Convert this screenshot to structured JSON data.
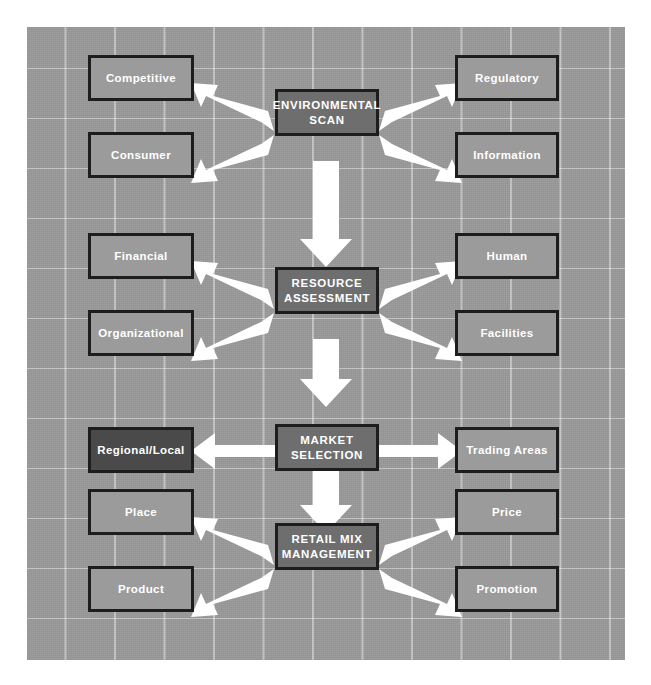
{
  "diagram": {
    "type": "flowchart",
    "background_color": "#9a9a9a",
    "grid_color": "#ffffff",
    "center_box_color": "#6e6e6e",
    "side_box_color": "#9b9b9b",
    "highlight_box_color": "#4a4a4a",
    "border_color": "#1d1d1d",
    "text_color": "#ffffff",
    "arrow_color": "#ffffff"
  },
  "stages": [
    {
      "id": "environmental-scan",
      "label": "ENVIRONMENTAL\nSCAN",
      "line1": "ENVIRONMENTAL",
      "line2": "SCAN",
      "left": [
        "Competitive",
        "Consumer"
      ],
      "right": [
        "Regulatory",
        "Information"
      ]
    },
    {
      "id": "resource-assessment",
      "label": "RESOURCE\nASSESSMENT",
      "line1": "RESOURCE",
      "line2": "ASSESSMENT",
      "left": [
        "Financial",
        "Organizational"
      ],
      "right": [
        "Human",
        "Facilities"
      ]
    },
    {
      "id": "market-selection",
      "label": "MARKET\nSELECTION",
      "line1": "MARKET",
      "line2": "SELECTION",
      "left": [
        "Regional/Local"
      ],
      "right": [
        "Trading Areas"
      ]
    },
    {
      "id": "retail-mix-management",
      "label": "RETAIL MIX\nMANAGEMENT",
      "line1": "RETAIL MIX",
      "line2": "MANAGEMENT",
      "left": [
        "Place",
        "Product"
      ],
      "right": [
        "Price",
        "Promotion"
      ]
    }
  ],
  "boxes": {
    "competitive": "Competitive",
    "consumer": "Consumer",
    "regulatory": "Regulatory",
    "information": "Information",
    "financial": "Financial",
    "organizational": "Organizational",
    "human": "Human",
    "facilities": "Facilities",
    "regional_local": "Regional/Local",
    "trading_areas": "Trading Areas",
    "place": "Place",
    "product": "Product",
    "price": "Price",
    "promotion": "Promotion",
    "env_scan_l1": "ENVIRONMENTAL",
    "env_scan_l2": "SCAN",
    "res_assess_l1": "RESOURCE",
    "res_assess_l2": "ASSESSMENT",
    "market_sel_l1": "MARKET",
    "market_sel_l2": "SELECTION",
    "retail_mix_l1": "RETAIL MIX",
    "retail_mix_l2": "MANAGEMENT"
  },
  "connectors": [
    {
      "name": "env-scan-to-competitive",
      "direction": "up-left"
    },
    {
      "name": "env-scan-to-consumer",
      "direction": "down-left"
    },
    {
      "name": "env-scan-to-regulatory",
      "direction": "up-right"
    },
    {
      "name": "env-scan-to-information",
      "direction": "down-right"
    },
    {
      "name": "env-scan-to-resource-assessment",
      "direction": "down"
    },
    {
      "name": "resource-assessment-to-financial",
      "direction": "up-left"
    },
    {
      "name": "resource-assessment-to-organizational",
      "direction": "down-left"
    },
    {
      "name": "resource-assessment-to-human",
      "direction": "up-right"
    },
    {
      "name": "resource-assessment-to-facilities",
      "direction": "down-right"
    },
    {
      "name": "resource-assessment-to-market-selection",
      "direction": "down"
    },
    {
      "name": "market-selection-to-regional-local",
      "direction": "left"
    },
    {
      "name": "market-selection-to-trading-areas",
      "direction": "right"
    },
    {
      "name": "market-selection-to-retail-mix",
      "direction": "down"
    },
    {
      "name": "retail-mix-to-place",
      "direction": "up-left"
    },
    {
      "name": "retail-mix-to-product",
      "direction": "down-left"
    },
    {
      "name": "retail-mix-to-price",
      "direction": "up-right"
    },
    {
      "name": "retail-mix-to-promotion",
      "direction": "down-right"
    }
  ]
}
